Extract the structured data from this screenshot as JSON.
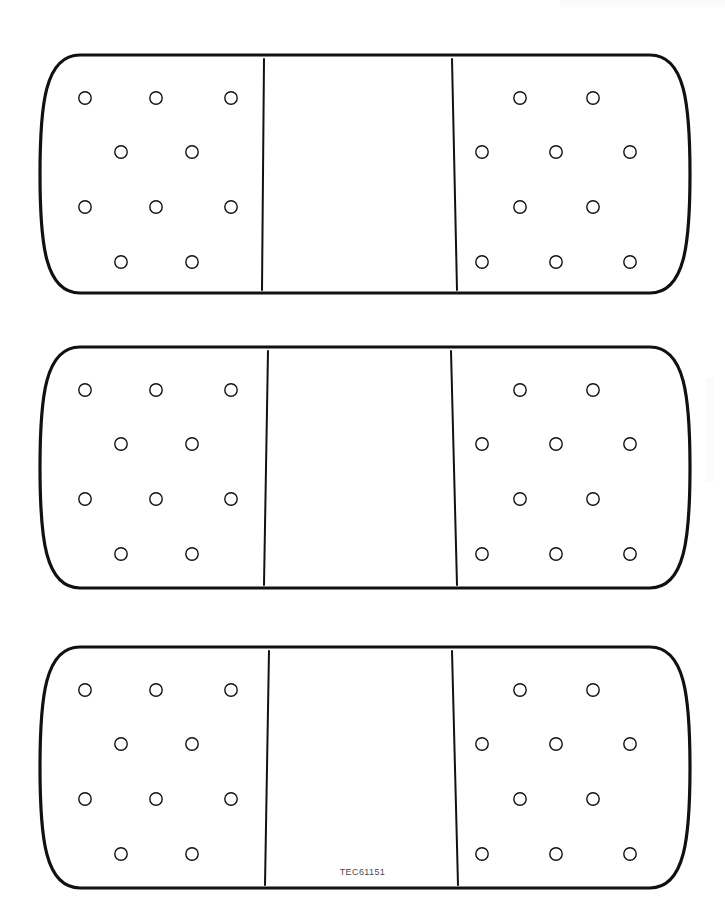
{
  "document": {
    "title": "TEC61151",
    "type": "line-art-illustration",
    "subject": "adhesive bandage",
    "background_color": "#ffffff",
    "stroke_color": "#111111",
    "page_width": 725,
    "page_height": 916
  },
  "caption": {
    "text": "TEC61151",
    "color": "#4a4a4a"
  },
  "figure": {
    "count": 3,
    "stroke_width_outline": 3.2,
    "stroke_width_hole": 1.4,
    "stroke_width_divider": 2.0,
    "hole_radius": 6.2,
    "items": [
      {
        "name": "bandage-1",
        "top": 55,
        "bottom": 293,
        "left": 40,
        "right": 690,
        "divider_left_top_x": 264,
        "divider_left_bottom_x": 262,
        "divider_right_top_x": 452,
        "divider_right_bottom_x": 457
      },
      {
        "name": "bandage-2",
        "top": 347,
        "bottom": 588,
        "left": 40,
        "right": 690,
        "divider_left_top_x": 268,
        "divider_left_bottom_x": 264,
        "divider_right_top_x": 451,
        "divider_right_bottom_x": 457
      },
      {
        "name": "bandage-3",
        "top": 647,
        "bottom": 888,
        "left": 40,
        "right": 690,
        "divider_left_top_x": 269,
        "divider_left_bottom_x": 265,
        "divider_right_top_x": 452,
        "divider_right_bottom_x": 458
      }
    ],
    "left_pad_rows": [
      {
        "row": 1,
        "dy": 43,
        "x": [
          85,
          156,
          231
        ]
      },
      {
        "row": 2,
        "dy": 97,
        "x": [
          121,
          192
        ]
      },
      {
        "row": 3,
        "dy": 152,
        "x": [
          85,
          156,
          231
        ]
      },
      {
        "row": 4,
        "dy": 207,
        "x": [
          121,
          192
        ]
      }
    ],
    "right_pad_rows": [
      {
        "row": 1,
        "dy": 43,
        "x": [
          520,
          593
        ]
      },
      {
        "row": 2,
        "dy": 97,
        "x": [
          482,
          556,
          630
        ]
      },
      {
        "row": 3,
        "dy": 152,
        "x": [
          520,
          593
        ]
      },
      {
        "row": 4,
        "dy": 207,
        "x": [
          482,
          556,
          630
        ]
      }
    ]
  }
}
